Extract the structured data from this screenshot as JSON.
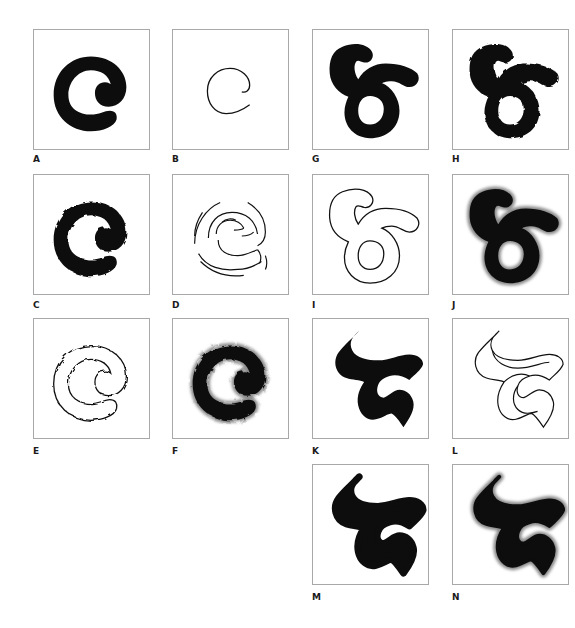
{
  "figure": {
    "panels": [
      {
        "id": "A",
        "label": "A",
        "description": "solid black C-shaped spiral, smooth edges"
      },
      {
        "id": "B",
        "label": "B",
        "description": "single thin centerline stroke of the C spiral"
      },
      {
        "id": "C",
        "label": "C",
        "description": "solid black C spiral with rough, blobby edges"
      },
      {
        "id": "D",
        "label": "D",
        "description": "multiple broken sketch strokes outlining the C spiral"
      },
      {
        "id": "E",
        "label": "E",
        "description": "outline-only version of the rough C spiral"
      },
      {
        "id": "F",
        "label": "F",
        "description": "black rough C spiral with gray soft halo edge"
      },
      {
        "id": "G",
        "label": "G",
        "description": "solid black looped '6'-like glyph with hook, smooth"
      },
      {
        "id": "H",
        "label": "H",
        "description": "solid black looped glyph with slightly rough edges"
      },
      {
        "id": "I",
        "label": "I",
        "description": "outline-only version of the looped glyph"
      },
      {
        "id": "J",
        "label": "J",
        "description": "black looped glyph with gray soft halo edge"
      },
      {
        "id": "K",
        "label": "K",
        "description": "solid black calligraphic brush-stroke glyph"
      },
      {
        "id": "L",
        "label": "L",
        "description": "outline-only version of calligraphic glyph"
      },
      {
        "id": "M",
        "label": "M",
        "description": "solid black calligraphic glyph, thicker rounded stroke"
      },
      {
        "id": "N",
        "label": "N",
        "description": "black calligraphic glyph with gray soft halo edge"
      }
    ]
  },
  "colors": {
    "fill": "#0d0d0d",
    "halo": "#8a8a8a",
    "border": "#a8a8a8"
  }
}
